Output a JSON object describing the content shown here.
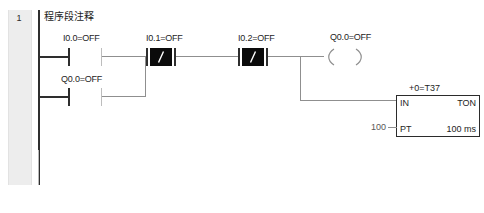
{
  "window": {
    "title": "Ladder Logic Network 1"
  },
  "network": {
    "number": "1",
    "comment": "程序段注释"
  },
  "colors": {
    "rail": "#2e2e2e",
    "wire": "#8f8f8f",
    "contact_dark": "#2e2e2e",
    "negated_fill": "#0b0b0b",
    "gutter": "#ededed",
    "text": "#1d1d1d",
    "box_border": "#2b2b2b"
  },
  "elements": {
    "contact_i00": {
      "label": "I0.0=OFF",
      "type": "normally-open-contact",
      "address": "I0.0",
      "state": "OFF"
    },
    "contact_q00_branch": {
      "label": "Q0.0=OFF",
      "type": "normally-open-contact",
      "address": "Q0.0",
      "state": "OFF"
    },
    "contact_i01": {
      "label": "I0.1=OFF",
      "type": "normally-closed-contact",
      "address": "I0.1",
      "state": "OFF",
      "glyph": "/"
    },
    "contact_i02": {
      "label": "I0.2=OFF",
      "type": "normally-closed-contact",
      "address": "I0.2",
      "state": "OFF",
      "glyph": "/"
    },
    "coil_q00": {
      "label": "Q0.0=OFF",
      "type": "output-coil",
      "address": "Q0.0",
      "state": "OFF"
    },
    "timer_t37": {
      "name_label": "+0=T37",
      "current_value": "+0",
      "address": "T37",
      "type": "TON",
      "in_label": "IN",
      "type_label": "TON",
      "pt_label": "PT",
      "pt_value": "100",
      "time_base": "100 ms"
    }
  }
}
